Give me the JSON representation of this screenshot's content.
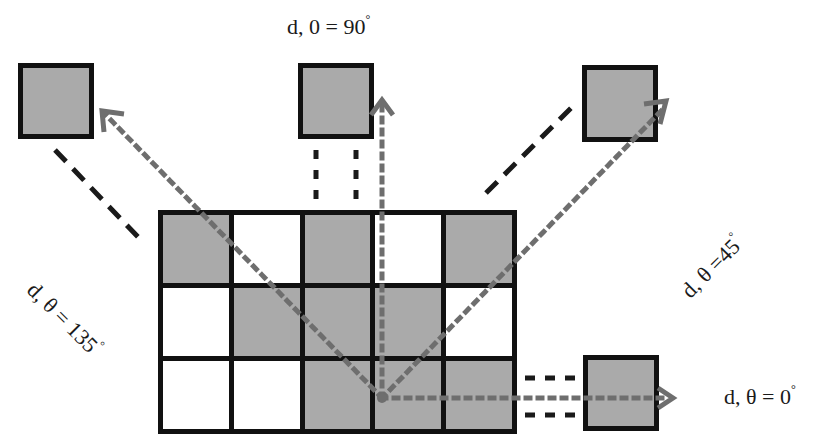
{
  "diagram": {
    "colors": {
      "filled": "#aaaaaa",
      "empty": "#ffffff",
      "border": "#111111",
      "arrow": "#6e6e6e",
      "dash": "#1a1a1a"
    },
    "grid": {
      "rows": 3,
      "cols": 5,
      "cells": [
        [
          "filled",
          "empty",
          "filled",
          "empty",
          "filled"
        ],
        [
          "empty",
          "filled",
          "filled",
          "filled",
          "empty"
        ],
        [
          "empty",
          "empty",
          "filled",
          "filled",
          "filled"
        ]
      ]
    },
    "origin_point": {
      "x": 382,
      "y": 398
    },
    "directions": [
      {
        "name": "0",
        "label_prefix": "d, θ = 0",
        "degree": "°"
      },
      {
        "name": "45",
        "label_prefix": "d, θ =45",
        "degree": "°"
      },
      {
        "name": "90",
        "label_prefix": "d, 0 = 90",
        "degree": "°"
      },
      {
        "name": "135",
        "label_prefix": "d, θ = 135",
        "degree": "°"
      }
    ]
  }
}
